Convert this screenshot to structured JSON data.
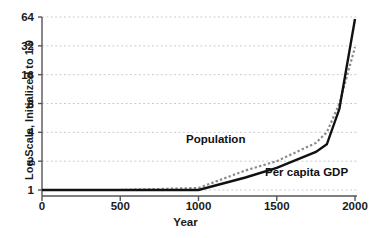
{
  "chart_data": {
    "type": "line",
    "title": "",
    "xlabel": "Year",
    "ylabel": "Log Scale, Initialized to 1.0",
    "xlim": [
      0,
      2000
    ],
    "ylim": [
      1,
      64
    ],
    "yscale": "log2",
    "grid": true,
    "legend_position": "inline-annotations",
    "xticks": [
      "0",
      "500",
      "1000",
      "1500",
      "2000"
    ],
    "xtick_values": [
      0,
      500,
      1000,
      1500,
      2000
    ],
    "yticks": [
      "1",
      "2",
      "4",
      "8",
      "16",
      "32",
      "64"
    ],
    "ytick_values": [
      1,
      2,
      4,
      8,
      16,
      32,
      64
    ],
    "series": [
      {
        "name": "Population",
        "style": "dotted",
        "color": "#8c8c8c",
        "x": [
          0,
          500,
          1000,
          1300,
          1500,
          1750,
          1820,
          1900,
          2000
        ],
        "values": [
          1.0,
          1.0,
          1.05,
          1.6,
          2.0,
          3.1,
          4.0,
          8.0,
          31.0
        ]
      },
      {
        "name": "Per capita GDP",
        "style": "solid",
        "color": "#111111",
        "x": [
          0,
          500,
          1000,
          1300,
          1500,
          1750,
          1820,
          1900,
          2000
        ],
        "values": [
          1.0,
          1.0,
          1.0,
          1.35,
          1.7,
          2.5,
          3.0,
          7.0,
          61.0
        ]
      }
    ],
    "annotations": [
      {
        "text": "Population",
        "x": 1180,
        "y": 5.6
      },
      {
        "text": "Per capita GDP",
        "x": 1620,
        "y": 1.85
      }
    ]
  },
  "axis": {
    "y_title": "Log Scale, Initialized to 1.0",
    "x_title": "Year",
    "y_labels": [
      "64",
      "32",
      "16",
      "8",
      "4",
      "2",
      "1"
    ],
    "x_labels": [
      "0",
      "500",
      "1000",
      "1500",
      "2000"
    ]
  },
  "labels": {
    "population": "Population",
    "per_capita_gdp": "Per capita GDP"
  },
  "colors": {
    "population_line": "#8c8c8c",
    "gdp_line": "#111111",
    "grid": "#cccccc",
    "axis": "#555555",
    "text": "#1a1a1a"
  }
}
